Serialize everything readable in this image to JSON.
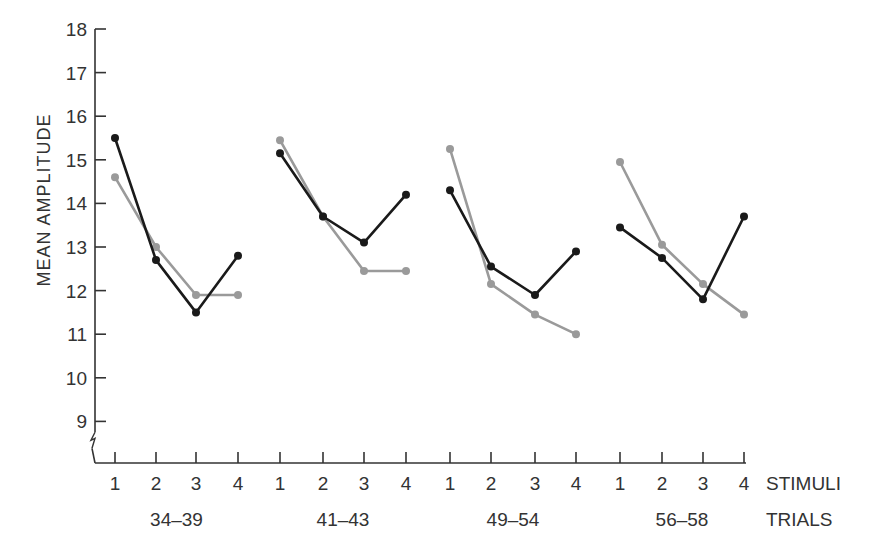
{
  "chart_data": {
    "type": "line",
    "title": "",
    "ylabel": "MEAN AMPLITUDE",
    "ylim": [
      8.5,
      18
    ],
    "y_axis_break": true,
    "yticks": [
      9,
      10,
      11,
      12,
      13,
      14,
      15,
      16,
      17,
      18
    ],
    "grid": false,
    "x_row1_label": "STIMULI",
    "x_row2_label": "TRIALS",
    "groups": [
      {
        "trials": "34–39",
        "stimuli": [
          "1",
          "2",
          "3",
          "4"
        ],
        "series": [
          {
            "name": "black",
            "color": "#1a1a1a",
            "values": [
              15.5,
              12.7,
              11.5,
              12.8
            ]
          },
          {
            "name": "gray",
            "color": "#999999",
            "values": [
              14.6,
              13.0,
              11.9,
              11.9
            ]
          }
        ]
      },
      {
        "trials": "41–43",
        "stimuli": [
          "1",
          "2",
          "3",
          "4"
        ],
        "series": [
          {
            "name": "black",
            "color": "#1a1a1a",
            "values": [
              15.15,
              13.7,
              13.1,
              14.2
            ]
          },
          {
            "name": "gray",
            "color": "#999999",
            "values": [
              15.45,
              13.7,
              12.45,
              12.45
            ]
          }
        ]
      },
      {
        "trials": "49–54",
        "stimuli": [
          "1",
          "2",
          "3",
          "4"
        ],
        "series": [
          {
            "name": "black",
            "color": "#1a1a1a",
            "values": [
              14.3,
              12.55,
              11.9,
              12.9
            ]
          },
          {
            "name": "gray",
            "color": "#999999",
            "values": [
              15.25,
              12.15,
              11.45,
              11.0
            ]
          }
        ]
      },
      {
        "trials": "56–58",
        "stimuli": [
          "1",
          "2",
          "3",
          "4"
        ],
        "series": [
          {
            "name": "black",
            "color": "#1a1a1a",
            "values": [
              13.45,
              12.75,
              11.8,
              13.7
            ]
          },
          {
            "name": "gray",
            "color": "#999999",
            "values": [
              14.95,
              13.05,
              12.15,
              11.45
            ]
          }
        ]
      }
    ],
    "legend": null
  },
  "layout": {
    "axis_x": 95,
    "baseline_y": 463,
    "y_top_value": 18,
    "y_top_px": 29,
    "px_per_unit": 43.6,
    "group_tick_x": [
      [
        115,
        156,
        196,
        238
      ],
      [
        280,
        323,
        364,
        406
      ],
      [
        450,
        491,
        535,
        576
      ],
      [
        620,
        662,
        703,
        744
      ]
    ],
    "axis_right_x": 746,
    "colors": {
      "axis": "#333333",
      "black_series": "#1a1a1a",
      "gray_series": "#9a9a9a"
    }
  }
}
